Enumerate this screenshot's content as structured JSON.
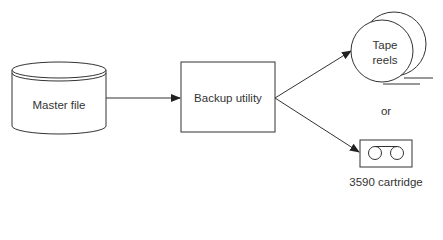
{
  "diagram": {
    "nodes": {
      "master_file": {
        "label": "Master file",
        "shape": "cylinder"
      },
      "backup_utility": {
        "label": "Backup utility",
        "shape": "rectangle"
      },
      "tape_reels": {
        "label_line1": "Tape",
        "label_line2": "reels",
        "shape": "reels"
      },
      "cartridge": {
        "label": "3590 cartridge",
        "shape": "cartridge"
      }
    },
    "connector_text": "or",
    "edges": [
      {
        "from": "master_file",
        "to": "backup_utility"
      },
      {
        "from": "backup_utility",
        "to": "tape_reels"
      },
      {
        "from": "backup_utility",
        "to": "cartridge"
      }
    ],
    "colors": {
      "stroke": "#333333",
      "text": "#333333",
      "background": "#ffffff"
    }
  }
}
